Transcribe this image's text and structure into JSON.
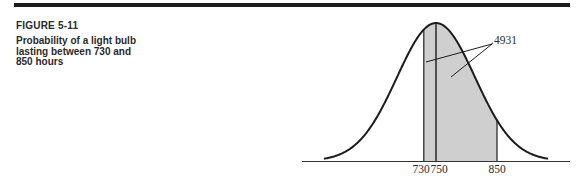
{
  "figure": {
    "number": "FIGURE 5-11",
    "title": "Probability of a light bulb lasting between 730 and 850 hours"
  },
  "colors": {
    "rule": "#1c1c1c",
    "curve": "#1c1c1c",
    "shade": "#cfcfcf",
    "text": "#2a2a2a"
  },
  "chart_data": {
    "type": "area",
    "title": "Probability of a light bulb lasting between 730 and 850 hours",
    "distribution": "normal",
    "mean": 750,
    "std_dev": 64,
    "x_ticks": [
      730,
      750,
      850
    ],
    "shaded_interval": [
      730,
      850
    ],
    "annotation": {
      "label": ".4931",
      "points_to": [
        "730-750 region",
        "750-850 region"
      ]
    },
    "xlabel": "",
    "ylabel": "",
    "grid": false,
    "legend": null
  },
  "ticks": {
    "t0": "730",
    "t1": "750",
    "t2": "850"
  },
  "annotation_label": ".4931"
}
